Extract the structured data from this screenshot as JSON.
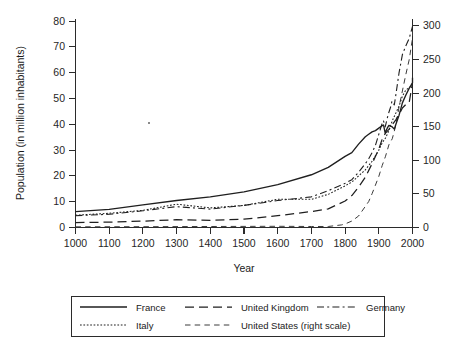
{
  "chart_data": {
    "type": "line",
    "title": "",
    "xlabel": "Year",
    "ylabel": "Population (in million inhabitants)",
    "y2label": "",
    "xlim": [
      1000,
      2000
    ],
    "ylim": [
      0,
      85
    ],
    "y2lim": [
      0,
      310
    ],
    "grid": false,
    "legend_position": "below",
    "xticks": [
      1000,
      1100,
      1200,
      1300,
      1400,
      1500,
      1600,
      1700,
      1800,
      1900,
      2000
    ],
    "yticks": [
      0,
      10,
      20,
      30,
      40,
      50,
      60,
      70,
      80
    ],
    "y2ticks": [
      0,
      50,
      100,
      150,
      200,
      250,
      300
    ],
    "series": [
      {
        "name": "France",
        "axis": "left",
        "style": "solid",
        "x": [
          1000,
          1100,
          1200,
          1300,
          1400,
          1500,
          1600,
          1700,
          1750,
          1800,
          1820,
          1840,
          1860,
          1870,
          1880,
          1890,
          1900,
          1910,
          1914,
          1919,
          1921,
          1925,
          1930,
          1936,
          1940,
          1946,
          1950,
          1960,
          1970,
          1980,
          1990,
          2000
        ],
        "y": [
          6.5,
          7.4,
          9.2,
          11.0,
          12.5,
          14.5,
          17.5,
          21.5,
          24.5,
          29.0,
          30.5,
          34.0,
          37.0,
          38.0,
          39.0,
          39.5,
          40.5,
          41.5,
          41.8,
          38.5,
          39.2,
          40.5,
          41.6,
          41.2,
          41.0,
          40.1,
          41.8,
          45.7,
          50.8,
          53.9,
          56.7,
          59.0
        ],
        "y_end": 61.0
      },
      {
        "name": "United Kingdom",
        "axis": "left",
        "style": "long-dash",
        "x": [
          1000,
          1100,
          1200,
          1300,
          1400,
          1500,
          1600,
          1700,
          1750,
          1800,
          1820,
          1840,
          1860,
          1880,
          1900,
          1910,
          1920,
          1930,
          1940,
          1950,
          1960,
          1970,
          1980,
          1990,
          2000
        ],
        "y": [
          2.0,
          2.2,
          2.6,
          3.2,
          2.9,
          3.4,
          4.8,
          6.5,
          7.6,
          10.8,
          13.0,
          16.5,
          20.5,
          26.0,
          32.0,
          36.0,
          38.5,
          40.0,
          42.0,
          43.8,
          46.0,
          48.7,
          50.1,
          50.8,
          59.0
        ],
        "y_end": 59.0
      },
      {
        "name": "Germany",
        "axis": "left",
        "style": "dash-dot",
        "x": [
          1000,
          1100,
          1200,
          1300,
          1400,
          1500,
          1600,
          1700,
          1750,
          1800,
          1820,
          1840,
          1860,
          1870,
          1880,
          1890,
          1900,
          1910,
          1914,
          1919,
          1925,
          1930,
          1936,
          1939,
          1946,
          1950,
          1960,
          1970,
          1980,
          1990,
          2000
        ],
        "y": [
          4.8,
          5.4,
          6.8,
          8.5,
          7.5,
          9.0,
          11.0,
          12.5,
          15.0,
          18.0,
          19.5,
          22.5,
          26.0,
          28.0,
          30.5,
          33.5,
          38.0,
          42.5,
          43.5,
          41.0,
          44.5,
          47.0,
          49.5,
          51.5,
          50.0,
          53.5,
          63.0,
          70.5,
          74.0,
          77.0,
          82.0
        ],
        "y_end": 82.0
      },
      {
        "name": "Italy",
        "axis": "left",
        "style": "dotted",
        "x": [
          1000,
          1100,
          1200,
          1300,
          1400,
          1500,
          1600,
          1700,
          1750,
          1800,
          1820,
          1840,
          1860,
          1880,
          1900,
          1910,
          1920,
          1930,
          1940,
          1950,
          1960,
          1970,
          1980,
          1990,
          2000
        ],
        "y": [
          5.0,
          5.8,
          7.0,
          9.5,
          8.0,
          9.0,
          11.5,
          11.5,
          13.5,
          17.0,
          18.5,
          21.0,
          23.5,
          27.0,
          31.5,
          34.5,
          36.5,
          39.5,
          43.5,
          46.5,
          49.5,
          53.5,
          56.0,
          57.0,
          58.0
        ],
        "y_end": 58.0
      },
      {
        "name": "United States (right scale)",
        "axis": "right",
        "style": "dash",
        "x": [
          1000,
          1200,
          1400,
          1600,
          1700,
          1750,
          1790,
          1800,
          1820,
          1840,
          1860,
          1870,
          1880,
          1890,
          1900,
          1910,
          1920,
          1930,
          1940,
          1950,
          1960,
          1970,
          1980,
          1990,
          2000
        ],
        "y": [
          1.0,
          1.2,
          1.5,
          1.8,
          1.5,
          1.5,
          3.9,
          5.3,
          9.6,
          17.1,
          31.4,
          38.6,
          50.2,
          63.0,
          76.0,
          92.0,
          106.0,
          123.0,
          132.0,
          151.0,
          179.0,
          203.0,
          227.0,
          249.0,
          281.0
        ],
        "y_end": 300.0
      }
    ]
  },
  "legend": {
    "entries": [
      {
        "label": "France",
        "style": "solid"
      },
      {
        "label": "United Kingdom",
        "style": "long-dash"
      },
      {
        "label": "Germany",
        "style": "dash-dot"
      },
      {
        "label": "Italy",
        "style": "dotted"
      },
      {
        "label": "United States (right scale)",
        "style": "dash"
      }
    ]
  },
  "colors": {
    "line": "#1f1f1f",
    "axis": "#2b2b2b",
    "background": "#ffffff"
  }
}
